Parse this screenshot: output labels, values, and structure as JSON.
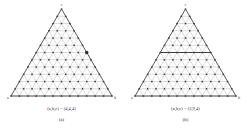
{
  "figure": {
    "background_color": "#ffffff",
    "line_color": "#8c8c8c",
    "edge_color": "#3c3c3c",
    "dot_color": "#3a3a3a",
    "highlight_color": "#2a2a2a",
    "panels": [
      {
        "id": "panel-a",
        "coord_caption": "(a,b,c) = (4,4,4)",
        "sub_caption": "(a)",
        "vertex_top_label": "c",
        "vertex_left_label": "a",
        "vertex_right_label": "b",
        "subdivisions": 12,
        "highlight": {
          "kind": "point",
          "row": 6,
          "col": 3,
          "label": "centroid-point"
        }
      },
      {
        "id": "panel-b",
        "coord_caption": "(a,b,c) = (3,9,4)",
        "sub_caption": "(b)",
        "vertex_top_label": "c",
        "vertex_left_label": "a",
        "vertex_right_label": "b",
        "subdivisions": 12,
        "highlight": {
          "kind": "row-line",
          "row": 6,
          "label": "level-line"
        }
      }
    ]
  }
}
